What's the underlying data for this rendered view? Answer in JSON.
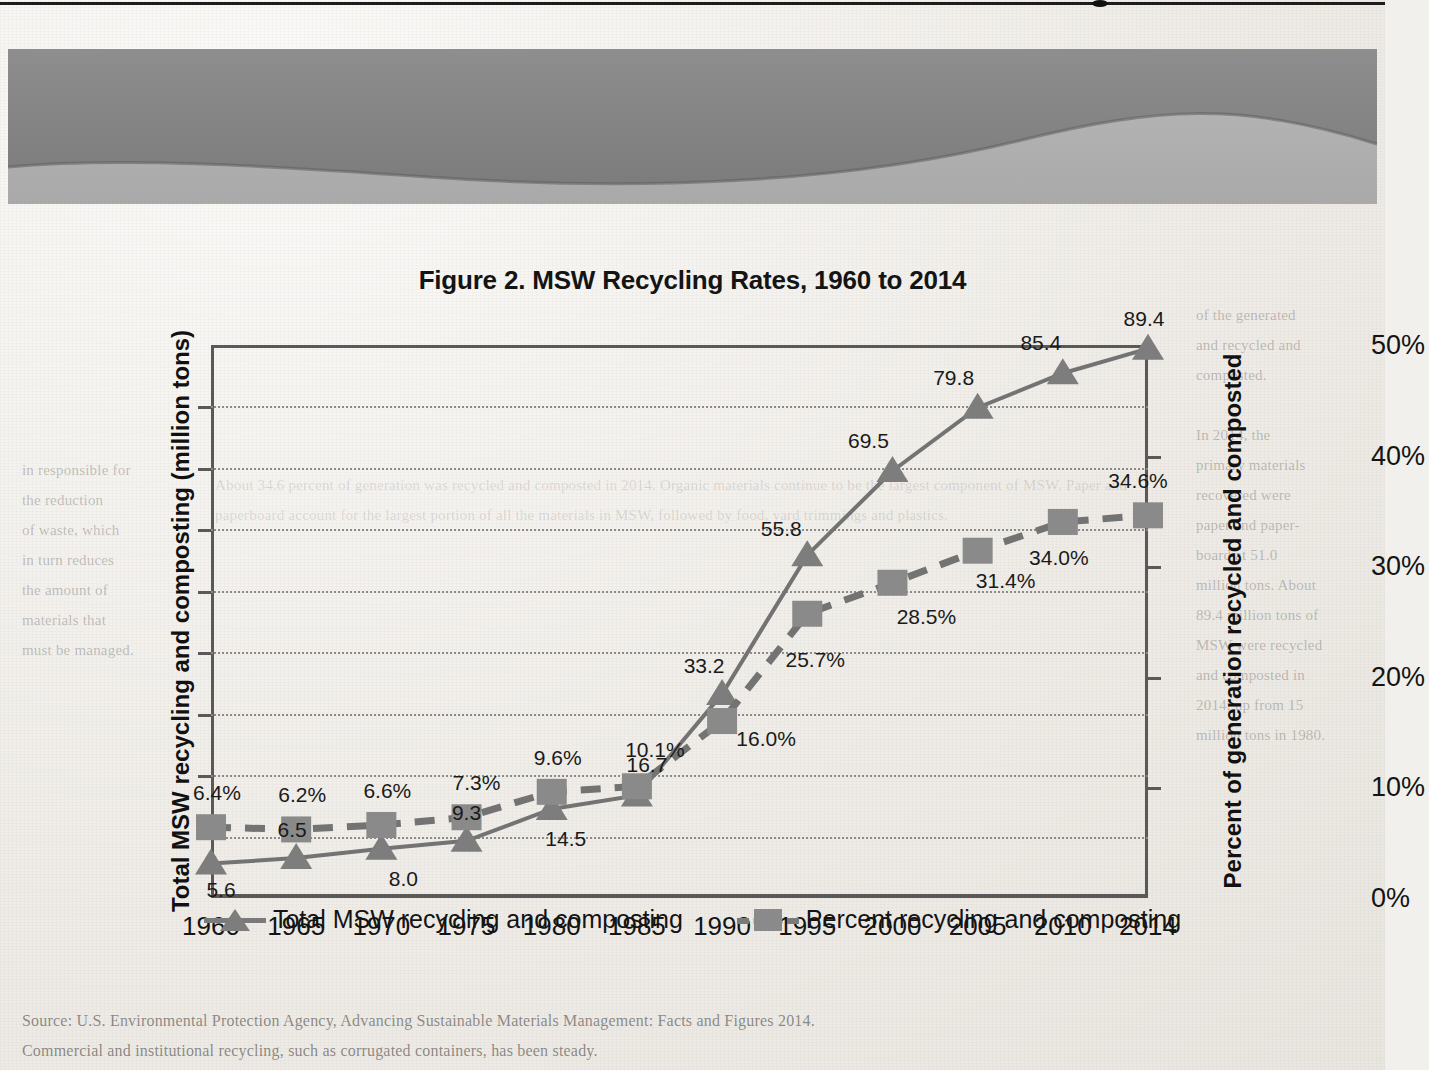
{
  "page": {
    "ghost_left": "in responsible for\nthe reduction\nof waste, which\nin turn reduces\nthe amount of\nmaterials that\nmust be managed.",
    "ghost_right": "of the generated\nand recycled and\ncomposted.\n\nIn 2014, the\nprimary materials\nrecovered were\npaper and paper-\nboard at 51.0\nmillion tons. About\n89.4 million tons of\nMSW were recycled\nand composted in\n2014, up from 15\nmillion tons in 1980.",
    "ghost_mid": "About 34.6 percent of generation was recycled and composted in 2014. Organic materials continue to be the largest component of MSW. Paper and paperboard account for the largest portion of all the materials in MSW, followed by food, yard trimmings and plastics.",
    "ghost_bottom": "Source: U.S. Environmental Protection Agency, Advancing Sustainable Materials Management: Facts and Figures 2014.\nCommercial and institutional recycling, such as corrugated containers, has been steady."
  },
  "figure": {
    "title": "Figure 2. MSW Recycling Rates, 1960 to 2014",
    "legend": [
      {
        "label": "Total MSW recycling and composting",
        "marker": "triangle",
        "line": "solid",
        "color": "#7d7d7d"
      },
      {
        "label": "Percent recycling and composting",
        "marker": "square",
        "line": "dashed",
        "color": "#8a8a8a"
      }
    ]
  },
  "chart_data": {
    "type": "line",
    "title": "Figure 2. MSW Recycling Rates, 1960 to 2014",
    "xlabel": "",
    "ylabel": "Total MSW recycling and composting (million tons)",
    "y2label": "Percent of generation recycled and composted",
    "categories": [
      "1960",
      "1965",
      "1970",
      "1975",
      "1980",
      "1985",
      "1990",
      "1995",
      "2000",
      "2005",
      "2010",
      "2014"
    ],
    "ylim": [
      0,
      90
    ],
    "yticks": [
      "0",
      "10",
      "20",
      "30",
      "40",
      "50",
      "60",
      "70",
      "80",
      "90"
    ],
    "y2lim": [
      0,
      50
    ],
    "y2ticks": [
      "0%",
      "10%",
      "20%",
      "30%",
      "40%",
      "50%"
    ],
    "grid": true,
    "legend_position": "bottom",
    "series": [
      {
        "name": "Total MSW recycling and composting",
        "axis": "left",
        "units": "million tons",
        "marker": "triangle",
        "line": "solid",
        "values": [
          5.6,
          6.5,
          8.0,
          9.3,
          14.5,
          16.7,
          33.2,
          55.8,
          69.5,
          79.8,
          85.4,
          89.4
        ],
        "labels": [
          "5.6",
          "6.5",
          "8.0",
          "9.3",
          "14.5",
          "16.7",
          "33.2",
          "55.8",
          "69.5",
          "79.8",
          "85.4",
          "89.4"
        ]
      },
      {
        "name": "Percent recycling and composting",
        "axis": "right",
        "units": "percent",
        "marker": "square",
        "line": "dashed",
        "values": [
          6.4,
          6.2,
          6.6,
          7.3,
          9.6,
          10.1,
          16.0,
          25.7,
          28.5,
          31.4,
          34.0,
          34.6
        ],
        "labels": [
          "6.4%",
          "6.2%",
          "6.6%",
          "7.3%",
          "9.6%",
          "10.1%",
          "16.0%",
          "25.7%",
          "28.5%",
          "31.4%",
          "34.0%",
          "34.6%"
        ]
      }
    ]
  }
}
